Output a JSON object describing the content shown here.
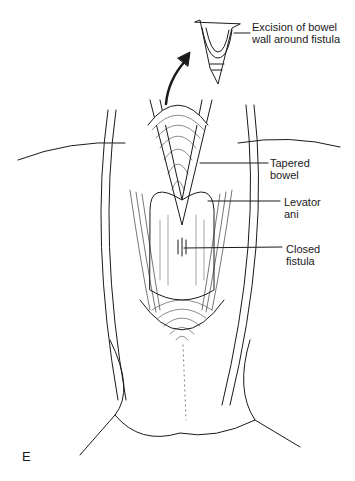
{
  "figure": {
    "panel_label": "E",
    "labels": [
      {
        "id": "excision",
        "lines": [
          "Excision of bowel",
          "wall around fistula"
        ]
      },
      {
        "id": "tapered-bowel",
        "lines": [
          "Tapered",
          "bowel"
        ]
      },
      {
        "id": "levator-ani",
        "lines": [
          "Levator",
          "ani"
        ]
      },
      {
        "id": "closed-fistula",
        "lines": [
          "Closed",
          "fistula"
        ]
      }
    ],
    "colors": {
      "ink": "#1a1a1a",
      "background": "#ffffff"
    }
  }
}
